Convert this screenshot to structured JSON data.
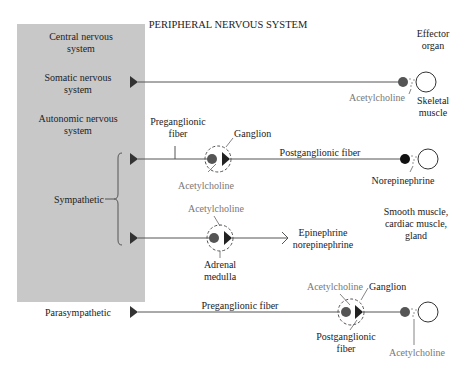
{
  "title": "PERIPHERAL NERVOUS SYSTEM",
  "cns_panel": {
    "color": "#c8c8c8",
    "labels": {
      "cns_line1": "Central nervous",
      "cns_line2": "system",
      "somatic_line1": "Somatic nervous",
      "somatic_line2": "system",
      "autonomic_line1": "Autonomic nervous",
      "autonomic_line2": "system",
      "sympathetic": "Sympathetic",
      "parasympathetic": "Parasympathetic"
    }
  },
  "effector_header": {
    "line1": "Effector",
    "line2": "organ"
  },
  "somatic": {
    "neurotransmitter": "Acetylcholine",
    "effector_line1": "Skeletal",
    "effector_line2": "muscle"
  },
  "sympathetic_ganglion": {
    "preganglionic_line1": "Preganglionic",
    "preganglionic_line2": "fiber",
    "ganglion": "Ganglion",
    "ganglion_neurotransmitter": "Acetylcholine",
    "postganglionic": "Postganglionic fiber",
    "effector_neurotransmitter": "Norepinephrine"
  },
  "sympathetic_adrenal": {
    "neurotransmitter": "Acetylcholine",
    "structure_line1": "Adrenal",
    "structure_line2": "medulla",
    "output_line1": "Epinephrine",
    "output_line2": "norepinephrine"
  },
  "autonomic_effectors": {
    "line1": "Smooth muscle,",
    "line2": "cardiac muscle,",
    "line3": "gland"
  },
  "parasympathetic": {
    "preganglionic": "Preganglionic fiber",
    "ganglion_neurotransmitter": "Acetylcholine",
    "ganglion": "Ganglion",
    "postganglionic_line1": "Postganglionic",
    "postganglionic_line2": "fiber",
    "effector_neurotransmitter": "Acetylcholine"
  }
}
